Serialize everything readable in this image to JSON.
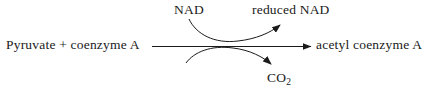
{
  "diagram": {
    "type": "biochemical-reaction-scheme",
    "stroke_color": "#1a1a1a",
    "background_color": "#ffffff",
    "main_reaction": {
      "substrate": "Pyruvate  +  coenzyme A",
      "product": "acetyl coenzyme A",
      "arrow_direction": "right"
    },
    "curved_arrows": [
      {
        "name": "cofactor-conversion",
        "from_label": "NAD",
        "to_label": "reduced NAD",
        "direction": "up-right"
      },
      {
        "name": "byproduct-release",
        "from_label": "",
        "to_label": "CO",
        "to_label_subscript": "2",
        "direction": "down-right"
      }
    ],
    "labels": {
      "substrate": "Pyruvate  +  coenzyme A",
      "product": "acetyl coenzyme A",
      "cofactor_in": "NAD",
      "cofactor_out": "reduced NAD",
      "byproduct": "CO",
      "byproduct_subscript": "2"
    }
  }
}
